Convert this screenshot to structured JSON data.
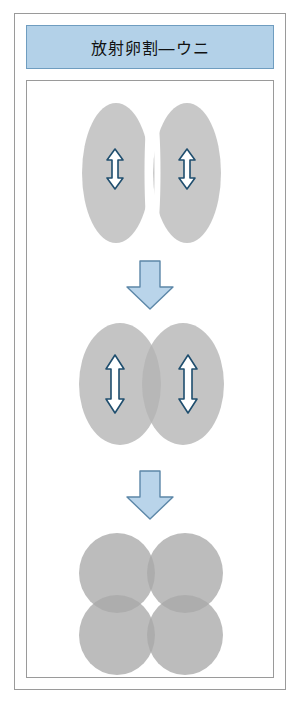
{
  "figure": {
    "title": "放射卵割—ウニ",
    "border_color": "#9a9a9a",
    "title_bg_color": "#b3d1e8",
    "title_border_color": "#6f9dc0",
    "cell_color": "#b8b8b8",
    "arrow_fill_color": "#b9d4ea",
    "arrow_stroke_color": "#5c87a8",
    "inner_arrow_stroke_color": "#1f4e6e"
  },
  "stages": [
    {
      "id": "stage-1",
      "name": "two-cell-stage-cleaving",
      "cell_count": 2,
      "arrow_labels": [
        "double-headed-arrow",
        "double-headed-arrow"
      ]
    },
    {
      "id": "stage-2",
      "name": "two-cell-stage-rounded",
      "cell_count": 2,
      "arrow_labels": [
        "double-headed-arrow",
        "double-headed-arrow"
      ]
    },
    {
      "id": "stage-3",
      "name": "four-cell-stage",
      "cell_count": 4,
      "arrow_labels": []
    }
  ],
  "transitions": [
    {
      "id": "transition-1",
      "name": "down-block-arrow"
    },
    {
      "id": "transition-2",
      "name": "down-block-arrow"
    }
  ]
}
